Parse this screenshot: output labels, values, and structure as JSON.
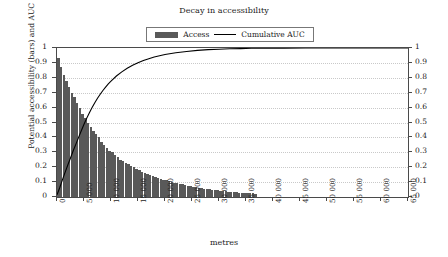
{
  "chart_data": {
    "type": "bar",
    "title": "Decay in accessibility",
    "xlabel": "metres",
    "ylabel": "Potential accessibility (bars) and AUC (line)",
    "xlim": [
      0,
      65000
    ],
    "ylim": [
      0,
      1
    ],
    "grid": true,
    "legend_position": "top-center",
    "x_tick_labels": [
      "0",
      "5 000",
      "10 000",
      "15 000",
      "20 000",
      "25 000",
      "30 000",
      "35 000",
      "40 000",
      "45 000",
      "50 000",
      "55 000",
      "60 000",
      "65 000"
    ],
    "x_tick_values": [
      0,
      5000,
      10000,
      15000,
      20000,
      25000,
      30000,
      35000,
      40000,
      45000,
      50000,
      55000,
      60000,
      65000
    ],
    "y_tick_labels": [
      "0",
      "0.1",
      "0.2",
      "0.3",
      "0.4",
      "0.5",
      "0.6",
      "0.7",
      "0.8",
      "0.9",
      "1"
    ],
    "y_tick_values": [
      0,
      0.1,
      0.2,
      0.3,
      0.4,
      0.5,
      0.6,
      0.7,
      0.8,
      0.9,
      1
    ],
    "y2_tick_labels": [
      "0",
      "0.1",
      "0.2",
      "0.3",
      "0.4",
      "0.5",
      "0.6",
      "0.7",
      "0.8",
      "0.9",
      "1"
    ],
    "y2_tick_values": [
      0,
      0.1,
      0.2,
      0.3,
      0.4,
      0.5,
      0.6,
      0.7,
      0.8,
      0.9,
      1
    ],
    "bar_color": "#595959",
    "line_color": "#000000",
    "series": [
      {
        "name": "Access",
        "type": "bar",
        "x": [
          250,
          750,
          1250,
          1750,
          2250,
          2750,
          3250,
          3750,
          4250,
          4750,
          5250,
          5750,
          6250,
          6750,
          7250,
          7750,
          8250,
          8750,
          9250,
          9750,
          10250,
          10750,
          11250,
          11750,
          12250,
          12750,
          13250,
          13750,
          14250,
          14750,
          15250,
          15750,
          16250,
          16750,
          17250,
          17750,
          18250,
          18750,
          19250,
          19750,
          20250,
          20750,
          21250,
          21750,
          22250,
          22750,
          23250,
          23750,
          24250,
          24750,
          25250,
          25750,
          26250,
          26750,
          27250,
          27750,
          28250,
          28750,
          29250,
          29750,
          30250,
          30750,
          31250,
          31750,
          32250,
          32750,
          33250,
          33750,
          34250,
          34750,
          35250,
          35750,
          36250,
          36750
        ],
        "values": [
          0.93,
          0.87,
          0.82,
          0.78,
          0.74,
          0.7,
          0.67,
          0.63,
          0.6,
          0.56,
          0.53,
          0.5,
          0.47,
          0.44,
          0.42,
          0.4,
          0.37,
          0.35,
          0.33,
          0.31,
          0.3,
          0.28,
          0.27,
          0.25,
          0.24,
          0.23,
          0.22,
          0.21,
          0.2,
          0.19,
          0.18,
          0.17,
          0.16,
          0.155,
          0.148,
          0.141,
          0.134,
          0.128,
          0.122,
          0.116,
          0.111,
          0.106,
          0.101,
          0.096,
          0.092,
          0.088,
          0.084,
          0.08,
          0.076,
          0.073,
          0.069,
          0.066,
          0.063,
          0.06,
          0.057,
          0.055,
          0.052,
          0.05,
          0.047,
          0.045,
          0.043,
          0.041,
          0.039,
          0.037,
          0.035,
          0.034,
          0.032,
          0.03,
          0.029,
          0.028,
          0.026,
          0.025,
          0.024,
          0.022
        ]
      },
      {
        "name": "Cumulative AUC",
        "type": "line",
        "x": [
          0,
          500,
          1000,
          1500,
          2000,
          2500,
          3000,
          3500,
          4000,
          4500,
          5000,
          5500,
          6000,
          6500,
          7000,
          7500,
          8000,
          8500,
          9000,
          9500,
          10000,
          11000,
          12000,
          13000,
          14000,
          15000,
          16000,
          17000,
          18000,
          19000,
          20000,
          22000,
          24000,
          26000,
          28000,
          30000,
          32000,
          34000,
          36000,
          38000,
          42000,
          46000,
          50000,
          55000,
          60000,
          65000
        ],
        "values": [
          0.015,
          0.062,
          0.115,
          0.165,
          0.215,
          0.262,
          0.31,
          0.355,
          0.4,
          0.445,
          0.488,
          0.528,
          0.565,
          0.6,
          0.633,
          0.663,
          0.69,
          0.715,
          0.738,
          0.759,
          0.778,
          0.812,
          0.84,
          0.864,
          0.884,
          0.901,
          0.916,
          0.928,
          0.939,
          0.948,
          0.956,
          0.968,
          0.977,
          0.984,
          0.989,
          0.992,
          0.995,
          0.996,
          0.998,
          0.999,
          0.999,
          1.0,
          1.0,
          1.0,
          1.0,
          1.0
        ]
      }
    ]
  },
  "legend": {
    "items": [
      {
        "label": "Access",
        "marker": "bar-swatch"
      },
      {
        "label": "Cumulative AUC",
        "marker": "line-swatch"
      }
    ]
  }
}
